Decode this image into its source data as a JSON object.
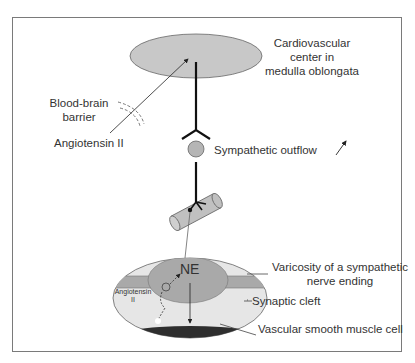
{
  "diagram": {
    "type": "physiology-schematic",
    "labels": {
      "cv_center_line1": "Cardiovascular",
      "cv_center_line2": "center in",
      "cv_center_line3": "medulla oblongata",
      "bbb_line1": "Blood-brain",
      "bbb_line2": "barrier",
      "angiotensin_main": "Angiotensin II",
      "sympathetic_outflow": "Sympathetic outflow",
      "varicosity_line1": "Varicosity of a sympathetic",
      "varicosity_line2": "nerve ending",
      "synaptic_cleft": "Synaptic cleft",
      "vsmc": "Vascular smooth muscle cell",
      "ne": "NE",
      "angiotensin_small_line1": "Angiotensin",
      "angiotensin_small_line2": "II",
      "plus_sign": "+"
    },
    "colors": {
      "frame": "#7a7a7a",
      "ellipse_fill": "#c8c8c8",
      "outer_cell_fill": "#e6e6e6",
      "varicosity_fill": "#a9a9a9",
      "muscle_fill": "#2e2e2e",
      "text": "#333333"
    }
  }
}
